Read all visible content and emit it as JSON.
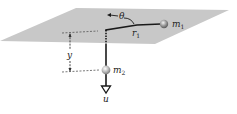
{
  "diagram": {
    "colors": {
      "plane": "#c8c8c8",
      "string": "#1a1a1a",
      "mass": "#8a8a8a",
      "mass_highlight": "#e6e6e6",
      "dashed": "#555555"
    },
    "labels": {
      "theta": "θ",
      "r": "r",
      "r_sub": "1",
      "m1": "m",
      "m1_sub": "1",
      "m2": "m",
      "m2_sub": "2",
      "y": "y",
      "u": "u"
    },
    "components": [
      {
        "name": "table-plane",
        "type": "parallelogram"
      },
      {
        "name": "mass-m1",
        "type": "sphere",
        "on": "plane"
      },
      {
        "name": "string-r1",
        "type": "line",
        "from": "m1",
        "to": "hole"
      },
      {
        "name": "hole",
        "type": "point"
      },
      {
        "name": "string-vertical",
        "type": "line",
        "from": "hole",
        "to": "m2"
      },
      {
        "name": "mass-m2",
        "type": "sphere",
        "hanging": true
      },
      {
        "name": "unit-vector-u",
        "type": "arrow",
        "direction": "down"
      },
      {
        "name": "theta-arrow",
        "type": "curved-arrow"
      },
      {
        "name": "y-dimension",
        "type": "dimension-line"
      }
    ]
  }
}
